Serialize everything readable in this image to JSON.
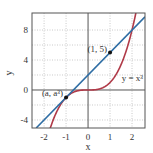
{
  "chart_data": {
    "type": "line",
    "title": "",
    "xlabel": "x",
    "ylabel": "y",
    "xlim": [
      -2.55,
      2.59
    ],
    "ylim": [
      -5.07,
      10.27
    ],
    "xticks": [
      -2,
      -1,
      0,
      1,
      2
    ],
    "xtick_labels": [
      "-2",
      "-1",
      "0",
      "1",
      "2"
    ],
    "yticks": [
      -4,
      0,
      4,
      8
    ],
    "ytick_labels": [
      "-4",
      "0",
      "4",
      "8"
    ],
    "grid": true,
    "grid_x": [
      -2,
      -1,
      1,
      2
    ],
    "grid_y": [
      -4,
      -2,
      2,
      4,
      6,
      8
    ],
    "series": [
      {
        "name": "y = x^3",
        "label_text": "y = x³",
        "color": "#b03a48",
        "function": "x^3",
        "x": [
          -1.72,
          -1.5,
          -1.25,
          -1.0,
          -0.75,
          -0.5,
          -0.25,
          0.0,
          0.25,
          0.5,
          0.75,
          1.0,
          1.25,
          1.5,
          1.75,
          2.0,
          2.17
        ],
        "y": [
          -5.09,
          -3.375,
          -1.953,
          -1.0,
          -0.422,
          -0.125,
          -0.016,
          0.0,
          0.016,
          0.125,
          0.422,
          1.0,
          1.953,
          3.375,
          5.359,
          8.0,
          10.22
        ]
      },
      {
        "name": "tangent line y = 3x + 2",
        "color": "#2e6da4",
        "function": "3x+2",
        "x": [
          -2.36,
          2.59
        ],
        "y": [
          -5.07,
          9.77
        ]
      }
    ],
    "points": [
      {
        "x": -1,
        "y": -1,
        "label": "(a, a³)"
      },
      {
        "x": 1,
        "y": 5,
        "label": "(1, 5)"
      }
    ],
    "annotations": [
      {
        "text": "(1, 5)",
        "x": 1,
        "y": 5
      },
      {
        "text": "(a, a³)",
        "x": -1,
        "y": -1
      },
      {
        "text": "y = x³",
        "x": 1.9,
        "y": 1.0
      }
    ],
    "legend": "none"
  }
}
